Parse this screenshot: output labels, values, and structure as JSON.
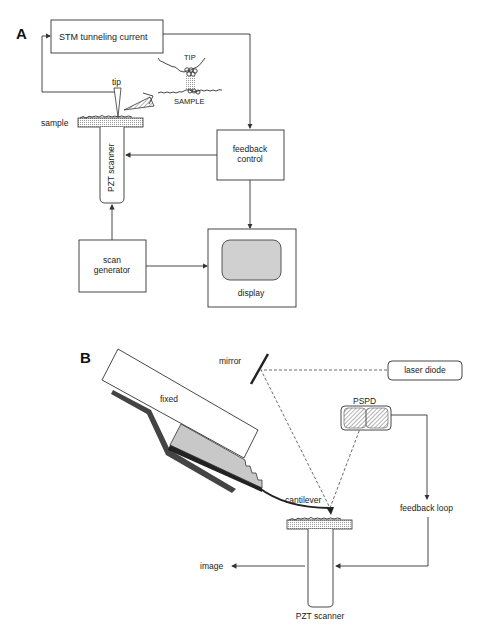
{
  "panels": {
    "a": {
      "label": "A",
      "stm_box": "STM tunneling current",
      "tip": "tip",
      "sample": "sample",
      "inset_tip": "TIP",
      "inset_sample": "SAMPLE",
      "pzt_scanner": "PZT scanner",
      "feedback_line1": "feedback",
      "feedback_line2": "control",
      "scan_line1": "scan",
      "scan_line2": "generator",
      "display": "display"
    },
    "b": {
      "label": "B",
      "fixed": "fixed",
      "mirror": "mirror",
      "laser_diode": "laser diode",
      "pspd": "PSPD",
      "cantilever": "cantilever",
      "feedback_loop": "feedback loop",
      "image": "image",
      "pzt_scanner": "PZT scanner"
    }
  }
}
